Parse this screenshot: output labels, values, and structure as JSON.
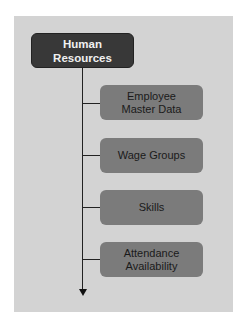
{
  "diagram": {
    "root": {
      "label": "Human\nResources"
    },
    "children": [
      {
        "label": "Employee\nMaster Data"
      },
      {
        "label": "Wage Groups"
      },
      {
        "label": "Skills"
      },
      {
        "label": "Attendance\nAvailability"
      }
    ],
    "colors": {
      "panel": "#d3d3d3",
      "root_fill": "#383838",
      "root_text": "#f0f0f0",
      "child_fill": "#7b7b7b",
      "child_text": "#1a1a1a",
      "connector": "#222222"
    }
  }
}
